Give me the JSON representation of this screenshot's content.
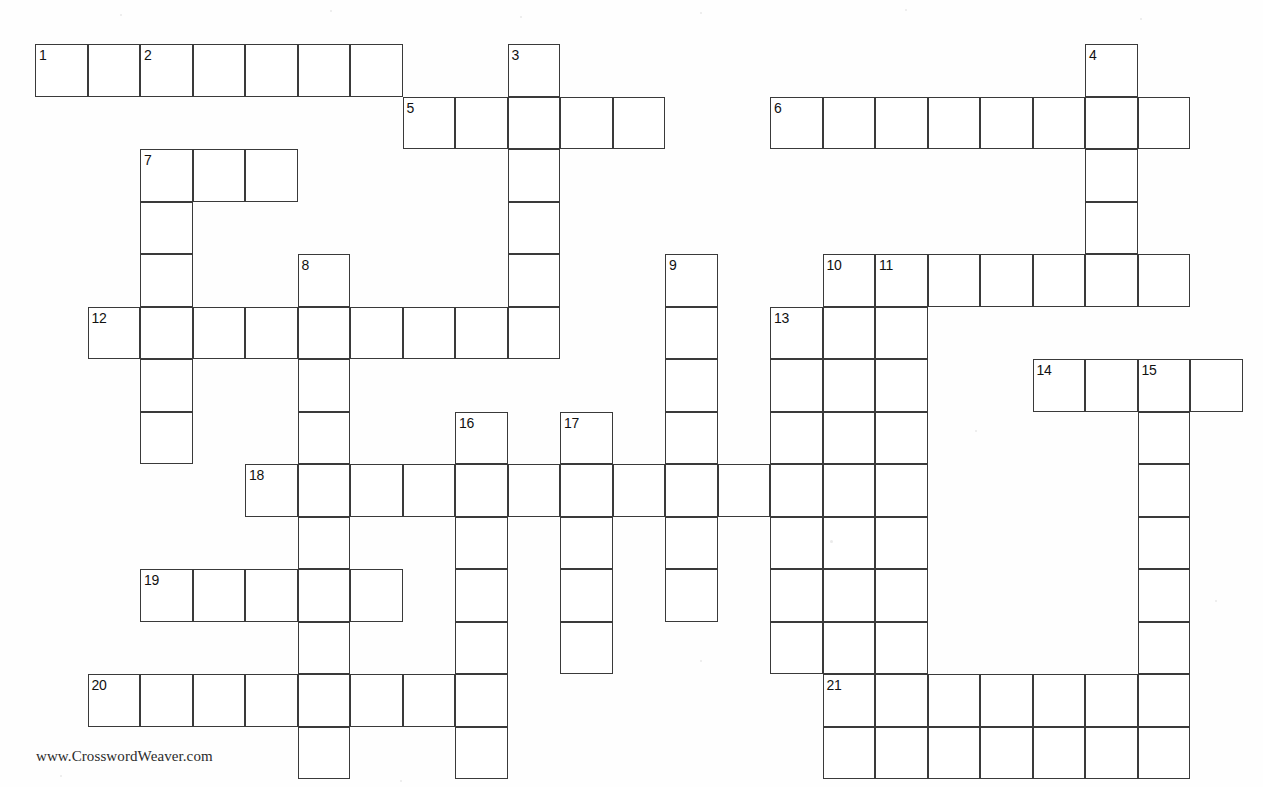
{
  "page": {
    "footer_credit": "www.CrosswordWeaver.com",
    "background_color": "#ffffff",
    "line_color": "#3a3a3a",
    "number_color": "#111111"
  },
  "grid": {
    "origin_x": 35,
    "origin_y": 44,
    "cell_size": 52.5,
    "columns": 23,
    "rows": 14,
    "cell_count": 168
  },
  "entries": [
    {
      "number": "1",
      "direction": "across",
      "col": 0,
      "row": 0,
      "length": 7
    },
    {
      "number": "2",
      "direction": "down",
      "col": 2,
      "row": 0,
      "length": 7
    },
    {
      "number": "3",
      "direction": "down",
      "col": 9,
      "row": 0,
      "length": 6
    },
    {
      "number": "4",
      "direction": "down",
      "col": 20,
      "row": 0,
      "length": 6
    },
    {
      "number": "5",
      "direction": "across",
      "col": 7,
      "row": 1,
      "length": 5
    },
    {
      "number": "6",
      "direction": "across",
      "col": 14,
      "row": 1,
      "length": 8
    },
    {
      "number": "7",
      "direction": "across",
      "col": 2,
      "row": 2,
      "length": 3
    },
    {
      "number": "8",
      "direction": "down",
      "col": 5,
      "row": 4,
      "length": 9
    },
    {
      "number": "9",
      "direction": "down",
      "col": 12,
      "row": 4,
      "length": 7
    },
    {
      "number": "10",
      "direction": "across",
      "col": 15,
      "row": 4,
      "length": 7
    },
    {
      "number": "10",
      "direction": "down",
      "col": 15,
      "row": 4,
      "length": 9
    },
    {
      "number": "11",
      "direction": "down",
      "col": 16,
      "row": 4,
      "length": 9
    },
    {
      "number": "12",
      "direction": "across",
      "col": 1,
      "row": 5,
      "length": 9
    },
    {
      "number": "13",
      "direction": "down",
      "col": 14,
      "row": 5,
      "length": 8
    },
    {
      "number": "14",
      "direction": "across",
      "col": 19,
      "row": 6,
      "length": 4
    },
    {
      "number": "15",
      "direction": "down",
      "col": 21,
      "row": 6,
      "length": 7
    },
    {
      "number": "16",
      "direction": "down",
      "col": 8,
      "row": 7,
      "length": 6
    },
    {
      "number": "17",
      "direction": "down",
      "col": 10,
      "row": 7,
      "length": 5
    },
    {
      "number": "18",
      "direction": "across",
      "col": 4,
      "row": 8,
      "length": 13
    },
    {
      "number": "19",
      "direction": "across",
      "col": 2,
      "row": 10,
      "length": 5
    },
    {
      "number": "20",
      "direction": "across",
      "col": 1,
      "row": 12,
      "length": 7
    },
    {
      "number": "21",
      "direction": "across",
      "col": 15,
      "row": 12,
      "length": 7
    }
  ],
  "cells": [
    {
      "c": 0,
      "r": 0,
      "n": "1"
    },
    {
      "c": 1,
      "r": 0
    },
    {
      "c": 2,
      "r": 0,
      "n": "2"
    },
    {
      "c": 3,
      "r": 0
    },
    {
      "c": 4,
      "r": 0
    },
    {
      "c": 5,
      "r": 0
    },
    {
      "c": 6,
      "r": 0
    },
    {
      "c": 9,
      "r": 0,
      "n": "3"
    },
    {
      "c": 20,
      "r": 0,
      "n": "4"
    },
    {
      "c": 7,
      "r": 1,
      "n": "5"
    },
    {
      "c": 8,
      "r": 1
    },
    {
      "c": 9,
      "r": 1
    },
    {
      "c": 10,
      "r": 1
    },
    {
      "c": 11,
      "r": 1
    },
    {
      "c": 14,
      "r": 1,
      "n": "6"
    },
    {
      "c": 15,
      "r": 1
    },
    {
      "c": 16,
      "r": 1
    },
    {
      "c": 17,
      "r": 1
    },
    {
      "c": 18,
      "r": 1
    },
    {
      "c": 19,
      "r": 1
    },
    {
      "c": 20,
      "r": 1
    },
    {
      "c": 21,
      "r": 1
    },
    {
      "c": 2,
      "r": 2,
      "n": "7"
    },
    {
      "c": 3,
      "r": 2
    },
    {
      "c": 4,
      "r": 2
    },
    {
      "c": 9,
      "r": 2
    },
    {
      "c": 20,
      "r": 2
    },
    {
      "c": 2,
      "r": 3
    },
    {
      "c": 9,
      "r": 3
    },
    {
      "c": 20,
      "r": 3
    },
    {
      "c": 2,
      "r": 4
    },
    {
      "c": 5,
      "r": 4,
      "n": "8"
    },
    {
      "c": 9,
      "r": 4
    },
    {
      "c": 12,
      "r": 4,
      "n": "9"
    },
    {
      "c": 15,
      "r": 4,
      "n": "10"
    },
    {
      "c": 16,
      "r": 4,
      "n": "11"
    },
    {
      "c": 17,
      "r": 4
    },
    {
      "c": 18,
      "r": 4
    },
    {
      "c": 19,
      "r": 4
    },
    {
      "c": 20,
      "r": 4
    },
    {
      "c": 21,
      "r": 4
    },
    {
      "c": 1,
      "r": 5,
      "n": "12"
    },
    {
      "c": 2,
      "r": 5
    },
    {
      "c": 3,
      "r": 5
    },
    {
      "c": 4,
      "r": 5
    },
    {
      "c": 5,
      "r": 5
    },
    {
      "c": 6,
      "r": 5
    },
    {
      "c": 7,
      "r": 5
    },
    {
      "c": 8,
      "r": 5
    },
    {
      "c": 9,
      "r": 5
    },
    {
      "c": 12,
      "r": 5
    },
    {
      "c": 14,
      "r": 5,
      "n": "13"
    },
    {
      "c": 15,
      "r": 5
    },
    {
      "c": 16,
      "r": 5
    },
    {
      "c": 2,
      "r": 6
    },
    {
      "c": 5,
      "r": 6
    },
    {
      "c": 12,
      "r": 6
    },
    {
      "c": 14,
      "r": 6
    },
    {
      "c": 15,
      "r": 6
    },
    {
      "c": 16,
      "r": 6
    },
    {
      "c": 19,
      "r": 6,
      "n": "14"
    },
    {
      "c": 20,
      "r": 6
    },
    {
      "c": 21,
      "r": 6,
      "n": "15"
    },
    {
      "c": 22,
      "r": 6
    },
    {
      "c": 2,
      "r": 7
    },
    {
      "c": 5,
      "r": 7
    },
    {
      "c": 8,
      "r": 7,
      "n": "16"
    },
    {
      "c": 10,
      "r": 7,
      "n": "17"
    },
    {
      "c": 12,
      "r": 7
    },
    {
      "c": 14,
      "r": 7
    },
    {
      "c": 15,
      "r": 7
    },
    {
      "c": 16,
      "r": 7
    },
    {
      "c": 21,
      "r": 7
    },
    {
      "c": 4,
      "r": 8,
      "n": "18"
    },
    {
      "c": 5,
      "r": 8
    },
    {
      "c": 6,
      "r": 8
    },
    {
      "c": 7,
      "r": 8
    },
    {
      "c": 8,
      "r": 8
    },
    {
      "c": 9,
      "r": 8
    },
    {
      "c": 10,
      "r": 8
    },
    {
      "c": 11,
      "r": 8
    },
    {
      "c": 12,
      "r": 8
    },
    {
      "c": 13,
      "r": 8
    },
    {
      "c": 14,
      "r": 8
    },
    {
      "c": 15,
      "r": 8
    },
    {
      "c": 16,
      "r": 8
    },
    {
      "c": 21,
      "r": 8
    },
    {
      "c": 5,
      "r": 9
    },
    {
      "c": 8,
      "r": 9
    },
    {
      "c": 10,
      "r": 9
    },
    {
      "c": 12,
      "r": 9
    },
    {
      "c": 14,
      "r": 9
    },
    {
      "c": 15,
      "r": 9
    },
    {
      "c": 16,
      "r": 9
    },
    {
      "c": 21,
      "r": 9
    },
    {
      "c": 2,
      "r": 10,
      "n": "19"
    },
    {
      "c": 3,
      "r": 10
    },
    {
      "c": 4,
      "r": 10
    },
    {
      "c": 5,
      "r": 10
    },
    {
      "c": 6,
      "r": 10
    },
    {
      "c": 8,
      "r": 10
    },
    {
      "c": 10,
      "r": 10
    },
    {
      "c": 12,
      "r": 10
    },
    {
      "c": 14,
      "r": 10
    },
    {
      "c": 15,
      "r": 10
    },
    {
      "c": 16,
      "r": 10
    },
    {
      "c": 21,
      "r": 10
    },
    {
      "c": 5,
      "r": 11
    },
    {
      "c": 8,
      "r": 11
    },
    {
      "c": 10,
      "r": 11
    },
    {
      "c": 14,
      "r": 11
    },
    {
      "c": 15,
      "r": 11
    },
    {
      "c": 16,
      "r": 11
    },
    {
      "c": 21,
      "r": 11
    },
    {
      "c": 1,
      "r": 12,
      "n": "20"
    },
    {
      "c": 2,
      "r": 12
    },
    {
      "c": 3,
      "r": 12
    },
    {
      "c": 4,
      "r": 12
    },
    {
      "c": 5,
      "r": 12
    },
    {
      "c": 6,
      "r": 12
    },
    {
      "c": 7,
      "r": 12
    },
    {
      "c": 8,
      "r": 12
    },
    {
      "c": 15,
      "r": 12,
      "n": "21"
    },
    {
      "c": 16,
      "r": 12
    },
    {
      "c": 17,
      "r": 12
    },
    {
      "c": 18,
      "r": 12
    },
    {
      "c": 19,
      "r": 12
    },
    {
      "c": 20,
      "r": 12
    },
    {
      "c": 21,
      "r": 12
    },
    {
      "c": 5,
      "r": 13
    },
    {
      "c": 8,
      "r": 13
    },
    {
      "c": 15,
      "r": 13
    },
    {
      "c": 16,
      "r": 13
    },
    {
      "c": 17,
      "r": 13
    },
    {
      "c": 18,
      "r": 13
    },
    {
      "c": 19,
      "r": 13
    },
    {
      "c": 20,
      "r": 13
    },
    {
      "c": 21,
      "r": 13
    }
  ],
  "specks": [
    {
      "x": 120,
      "y": 14,
      "s": 2
    },
    {
      "x": 330,
      "y": 10,
      "s": 2
    },
    {
      "x": 520,
      "y": 16,
      "s": 2
    },
    {
      "x": 700,
      "y": 12,
      "s": 2
    },
    {
      "x": 905,
      "y": 9,
      "s": 2
    },
    {
      "x": 1140,
      "y": 18,
      "s": 2
    },
    {
      "x": 60,
      "y": 775,
      "s": 2
    },
    {
      "x": 400,
      "y": 780,
      "s": 2
    },
    {
      "x": 830,
      "y": 540,
      "s": 3
    },
    {
      "x": 975,
      "y": 430,
      "s": 2
    },
    {
      "x": 700,
      "y": 660,
      "s": 2
    },
    {
      "x": 1215,
      "y": 600,
      "s": 2
    }
  ]
}
